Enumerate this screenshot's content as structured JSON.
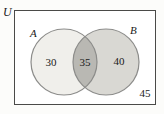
{
  "diagram": {
    "type": "venn",
    "universe_label": "U",
    "sets": {
      "a": {
        "label": "A",
        "only_value": "30"
      },
      "b": {
        "label": "B",
        "only_value": "40"
      }
    },
    "intersection_value": "35",
    "outside_value": "45",
    "colors": {
      "set_a_fill": "#f0efeb",
      "set_b_fill": "#d9d8d3",
      "intersection_fill": "#b9b8b3",
      "circle_stroke": "#8c8c8a",
      "rect_stroke": "#4a4a48",
      "background": "#fcfcfa",
      "text": "#1a1a1a"
    }
  }
}
